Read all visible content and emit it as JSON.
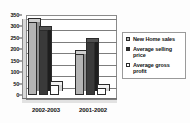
{
  "chart_data": {
    "type": "bar",
    "title": "",
    "subtitle": "",
    "xlabel": "",
    "ylabel": "",
    "categories": [
      "2002-2003",
      "2001-2002"
    ],
    "series": [
      {
        "name": "New Home sales",
        "values": [
          318,
          178
        ],
        "color": "#b4b4b4"
      },
      {
        "name": "Average selling price",
        "values": [
          285,
          232
        ],
        "color": "#2e2e2e"
      },
      {
        "name": "Average gross profit",
        "values": [
          45,
          30
        ],
        "color": "#ffffff"
      }
    ],
    "ylim": [
      0,
      350
    ],
    "yticks": [
      0,
      50,
      100,
      150,
      200,
      250,
      300,
      350
    ],
    "ytick_labels": [
      "0",
      "50",
      "100",
      "150",
      "200",
      "250",
      "300",
      "350"
    ],
    "grid": true,
    "grid_axis": "y",
    "legend_position": "right",
    "style_3d": true
  },
  "legend": {
    "items": [
      {
        "label": "New Home sales"
      },
      {
        "label": "Average selling price"
      },
      {
        "label": "Average gross profit"
      }
    ]
  }
}
